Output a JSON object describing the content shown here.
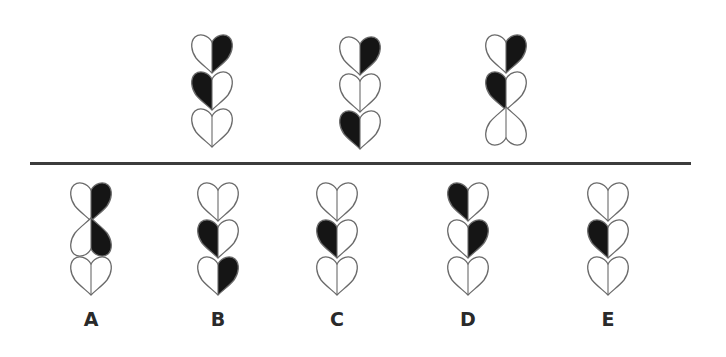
{
  "colors": {
    "fill_dark": "#151515",
    "outline": "#6a6a6a",
    "divider": "#3c3c3c",
    "label": "#2a2a2a"
  },
  "question_figures": [
    {
      "id": "figure-1",
      "x": 212,
      "y": 33,
      "hearts": [
        {
          "left": "white",
          "right": "black",
          "orientation": "down"
        },
        {
          "left": "black",
          "right": "white",
          "orientation": "down"
        },
        {
          "left": "white",
          "right": "white",
          "orientation": "down"
        }
      ]
    },
    {
      "id": "figure-2",
      "x": 360,
      "y": 35,
      "hearts": [
        {
          "left": "white",
          "right": "black",
          "orientation": "down"
        },
        {
          "left": "white",
          "right": "white",
          "orientation": "down"
        },
        {
          "left": "black",
          "right": "white",
          "orientation": "down"
        }
      ]
    },
    {
      "id": "figure-3",
      "x": 506,
      "y": 33,
      "hearts": [
        {
          "left": "white",
          "right": "black",
          "orientation": "down"
        },
        {
          "left": "black",
          "right": "white",
          "orientation": "down"
        },
        {
          "left": "white",
          "right": "white",
          "orientation": "up"
        }
      ]
    }
  ],
  "answer_options": [
    {
      "label": "A",
      "x": 91,
      "y": 181,
      "hearts": [
        {
          "left": "white",
          "right": "black",
          "orientation": "down"
        },
        {
          "left": "black",
          "right": "white",
          "orientation": "up"
        },
        {
          "left": "white",
          "right": "white",
          "orientation": "down"
        }
      ]
    },
    {
      "label": "B",
      "x": 218,
      "y": 181,
      "hearts": [
        {
          "left": "white",
          "right": "white",
          "orientation": "down"
        },
        {
          "left": "black",
          "right": "white",
          "orientation": "down"
        },
        {
          "left": "white",
          "right": "black",
          "orientation": "down"
        }
      ]
    },
    {
      "label": "C",
      "x": 337,
      "y": 181,
      "hearts": [
        {
          "left": "white",
          "right": "white",
          "orientation": "down"
        },
        {
          "left": "black",
          "right": "white",
          "orientation": "down"
        },
        {
          "left": "white",
          "right": "white",
          "orientation": "down"
        }
      ]
    },
    {
      "label": "D",
      "x": 468,
      "y": 181,
      "hearts": [
        {
          "left": "black",
          "right": "white",
          "orientation": "down"
        },
        {
          "left": "white",
          "right": "black",
          "orientation": "down"
        },
        {
          "left": "white",
          "right": "white",
          "orientation": "down"
        }
      ]
    },
    {
      "label": "E",
      "x": 608,
      "y": 181,
      "hearts": [
        {
          "left": "white",
          "right": "white",
          "orientation": "down"
        },
        {
          "left": "black",
          "right": "white",
          "orientation": "down"
        },
        {
          "left": "white",
          "right": "white",
          "orientation": "down"
        }
      ]
    }
  ]
}
